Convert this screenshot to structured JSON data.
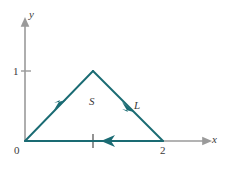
{
  "figure": {
    "colors": {
      "curve": "#1a6b73",
      "axis": "#9a9a9a",
      "axis_arrow": "#9a9a9a",
      "text": "#3a3a3a",
      "background": "#ffffff"
    },
    "axes": {
      "x_axis_label": "x",
      "y_axis_label": "y",
      "origin_label": "0",
      "x_ticks": [
        {
          "value": 2,
          "label": "2"
        }
      ],
      "y_ticks": [
        {
          "value": 1,
          "label": "1"
        }
      ],
      "x_unlabeled_ticks": [
        1
      ],
      "x_range": [
        0,
        2.6
      ],
      "y_range": [
        0,
        1.45
      ]
    },
    "region_label": "S",
    "curve_label": "L",
    "curve": {
      "type": "closed_polygon",
      "orientation": "clockwise",
      "vertices": [
        {
          "x": 0,
          "y": 0
        },
        {
          "x": 1,
          "y": 1
        },
        {
          "x": 2,
          "y": 0
        }
      ],
      "segments": [
        {
          "from": [
            0,
            0
          ],
          "to": [
            1,
            1
          ],
          "direction": "up-right",
          "arrow_at": 0.45
        },
        {
          "from": [
            1,
            1
          ],
          "to": [
            2,
            0
          ],
          "direction": "down-right",
          "arrow_at": 0.62
        },
        {
          "from": [
            2,
            0
          ],
          "to": [
            0,
            0
          ],
          "direction": "left",
          "arrow_at": 0.58
        }
      ]
    }
  }
}
